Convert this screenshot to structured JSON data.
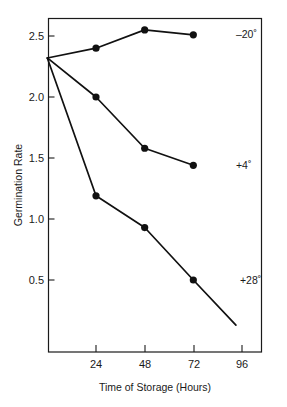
{
  "chart_data": {
    "type": "line",
    "title": "",
    "xlabel": "Time of Storage (Hours)",
    "ylabel": "Germination Rate",
    "xlim": [
      0,
      112
    ],
    "ylim": [
      0,
      2.72
    ],
    "grid": false,
    "legend_position": "inline-right-of-last-point",
    "xticks": [
      24,
      48,
      72,
      96
    ],
    "xtick_labels": [
      "24",
      "48",
      "72",
      "96"
    ],
    "yticks": [
      0.5,
      1.0,
      1.5,
      2.0,
      2.5
    ],
    "ytick_labels": [
      "0.5",
      "1.0",
      "1.5",
      "2.0",
      "2.5"
    ],
    "x": [
      0,
      24,
      48,
      72
    ],
    "series": [
      {
        "name": "-20°",
        "label": "–20˚",
        "color": "#111111",
        "values": [
          2.32,
          2.4,
          2.55,
          2.51
        ],
        "marker": "filled-circle",
        "label_x": 93,
        "label_y": 2.51
      },
      {
        "name": "+4°",
        "label": "+4˚",
        "color": "#111111",
        "values": [
          2.32,
          2.0,
          1.58,
          1.44
        ],
        "marker": "filled-circle",
        "label_x": 93,
        "label_y": 1.44
      },
      {
        "name": "+28°",
        "label": "+28˚",
        "color": "#111111",
        "values": [
          2.32,
          1.19,
          0.93,
          0.5
        ],
        "marker": "filled-circle",
        "extension_to": {
          "x": 93,
          "y": 0.13
        },
        "label_x": 95,
        "label_y": 0.5
      }
    ]
  },
  "axes": {
    "y_title": "Germination Rate",
    "x_title": "Time of Storage (Hours)",
    "ytick_0": "0.5",
    "ytick_1": "1.0",
    "ytick_2": "1.5",
    "ytick_3": "2.0",
    "ytick_4": "2.5",
    "xtick_0": "24",
    "xtick_1": "48",
    "xtick_2": "72",
    "xtick_3": "96"
  },
  "series_labels": {
    "cold": "–20˚",
    "fridge": "+4˚",
    "warm": "+28˚"
  },
  "colors": {
    "ink": "#111111",
    "frame": "#1a1a1a",
    "background": "#ffffff"
  }
}
